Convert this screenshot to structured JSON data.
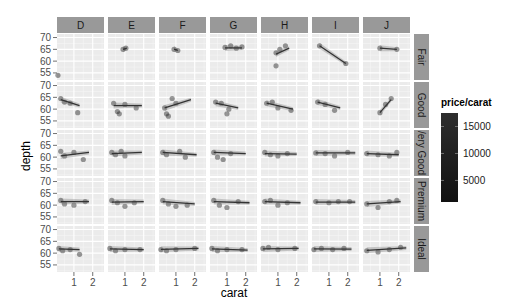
{
  "chart_data": {
    "type": "scatter",
    "title": "",
    "xlabel": "carat",
    "ylabel": "depth",
    "facet_cols": [
      "D",
      "E",
      "F",
      "G",
      "H",
      "I",
      "J"
    ],
    "facet_rows": [
      "Fair",
      "Good",
      "Very Good",
      "Premium",
      "Ideal"
    ],
    "facet_rows_displayed": [
      "Fair",
      "Good",
      "/ery Good",
      "Premium",
      "Ideal"
    ],
    "x_ticks": [
      1,
      2
    ],
    "y_ticks": [
      55,
      60,
      65,
      70
    ],
    "xlim": [
      0.1,
      2.6
    ],
    "ylim": [
      52,
      71.5
    ],
    "grid": true,
    "color_legend": {
      "title": "price/carat",
      "ticks": [
        5000,
        10000,
        15000
      ],
      "range": [
        1000,
        17500
      ],
      "low_color": "#2b2b2b",
      "high_color": "#0d0d0d",
      "position": "right"
    },
    "smooth_lines": {
      "Fair": {
        "D": null,
        "E": [
          [
            0.9,
            65.0
          ],
          [
            1.1,
            65.5
          ]
        ],
        "F": [
          [
            0.9,
            65.1
          ],
          [
            1.1,
            64.6
          ]
        ],
        "G": [
          [
            0.9,
            65.6
          ],
          [
            1.8,
            65.6
          ]
        ],
        "H": [
          [
            0.9,
            63.0
          ],
          [
            1.6,
            65.5
          ]
        ],
        "I": [
          [
            0.5,
            66.5
          ],
          [
            1.9,
            59.0
          ]
        ],
        "J": [
          [
            1.0,
            65.5
          ],
          [
            1.9,
            65.0
          ]
        ]
      },
      "Good": {
        "D": [
          [
            0.3,
            64.0
          ],
          [
            1.3,
            61.5
          ]
        ],
        "E": [
          [
            0.4,
            61.5
          ],
          [
            1.9,
            61.5
          ]
        ],
        "F": [
          [
            0.4,
            60.5
          ],
          [
            1.8,
            64.0
          ]
        ],
        "G": [
          [
            0.4,
            62.5
          ],
          [
            1.6,
            60.5
          ]
        ],
        "H": [
          [
            0.4,
            62.5
          ],
          [
            1.8,
            60.0
          ]
        ],
        "I": [
          [
            0.4,
            63.0
          ],
          [
            1.6,
            60.5
          ]
        ],
        "J": [
          [
            1.0,
            58.5
          ],
          [
            1.6,
            64.0
          ]
        ]
      },
      "Very Good": {
        "D": [
          [
            0.3,
            60.5
          ],
          [
            1.8,
            62.0
          ]
        ],
        "E": [
          [
            0.3,
            61.5
          ],
          [
            1.9,
            62.0
          ]
        ],
        "F": [
          [
            0.3,
            62.0
          ],
          [
            2.1,
            61.0
          ]
        ],
        "G": [
          [
            0.3,
            62.0
          ],
          [
            2.0,
            61.5
          ]
        ],
        "H": [
          [
            0.3,
            61.5
          ],
          [
            2.0,
            61.3
          ]
        ],
        "I": [
          [
            0.3,
            61.8
          ],
          [
            2.4,
            61.8
          ]
        ],
        "J": [
          [
            0.3,
            61.5
          ],
          [
            2.0,
            61.0
          ]
        ]
      },
      "Premium": {
        "D": [
          [
            0.3,
            61.5
          ],
          [
            1.8,
            61.5
          ]
        ],
        "E": [
          [
            0.3,
            61.3
          ],
          [
            2.0,
            61.5
          ]
        ],
        "F": [
          [
            0.3,
            61.5
          ],
          [
            2.0,
            60.5
          ]
        ],
        "G": [
          [
            0.3,
            61.5
          ],
          [
            2.2,
            61.0
          ]
        ],
        "H": [
          [
            0.3,
            61.5
          ],
          [
            2.2,
            61.0
          ]
        ],
        "I": [
          [
            0.3,
            61.3
          ],
          [
            2.4,
            61.3
          ]
        ],
        "J": [
          [
            0.3,
            60.5
          ],
          [
            2.1,
            61.5
          ]
        ]
      },
      "Ideal": {
        "D": [
          [
            0.2,
            61.8
          ],
          [
            1.3,
            61.5
          ]
        ],
        "E": [
          [
            0.2,
            61.8
          ],
          [
            2.0,
            61.5
          ]
        ],
        "F": [
          [
            0.2,
            61.6
          ],
          [
            2.2,
            62.0
          ]
        ],
        "G": [
          [
            0.2,
            61.8
          ],
          [
            2.1,
            61.3
          ]
        ],
        "H": [
          [
            0.2,
            61.8
          ],
          [
            2.1,
            62.0
          ]
        ],
        "I": [
          [
            0.2,
            61.8
          ],
          [
            2.2,
            61.7
          ]
        ],
        "J": [
          [
            0.3,
            61.2
          ],
          [
            2.4,
            62.2
          ]
        ]
      }
    },
    "point_clusters": {
      "Fair": {
        "D": [
          [
            0.15,
            54.0
          ]
        ],
        "E": [
          [
            0.9,
            65.0
          ],
          [
            1.05,
            65.5
          ]
        ],
        "F": [
          [
            0.9,
            65.0
          ],
          [
            1.1,
            64.5
          ]
        ],
        "G": [
          [
            0.9,
            65.8
          ],
          [
            1.2,
            66.5
          ],
          [
            1.5,
            65.5
          ],
          [
            1.8,
            66.0
          ]
        ],
        "H": [
          [
            0.9,
            63.5
          ],
          [
            1.1,
            65.0
          ],
          [
            1.4,
            66.5
          ],
          [
            0.9,
            58.0
          ]
        ],
        "I": [
          [
            0.5,
            66.5
          ],
          [
            1.9,
            59.0
          ]
        ],
        "J": [
          [
            1.0,
            65.5
          ],
          [
            1.9,
            65.0
          ]
        ]
      },
      "Good": {
        "D": [
          [
            0.3,
            64.5
          ],
          [
            0.5,
            63.0
          ],
          [
            0.8,
            62.5
          ],
          [
            1.2,
            58.5
          ]
        ],
        "E": [
          [
            0.4,
            62.5
          ],
          [
            0.6,
            59.0
          ],
          [
            0.7,
            58.0
          ],
          [
            1.0,
            62.0
          ],
          [
            1.6,
            60.5
          ]
        ],
        "F": [
          [
            0.4,
            60.5
          ],
          [
            0.5,
            58.0
          ],
          [
            0.8,
            64.5
          ],
          [
            1.0,
            62.5
          ],
          [
            0.6,
            57.0
          ]
        ],
        "G": [
          [
            0.4,
            63.0
          ],
          [
            0.7,
            62.5
          ],
          [
            1.1,
            60.0
          ],
          [
            1.0,
            58.0
          ]
        ],
        "H": [
          [
            0.4,
            62.5
          ],
          [
            0.7,
            63.0
          ],
          [
            1.0,
            60.5
          ],
          [
            1.7,
            59.5
          ]
        ],
        "I": [
          [
            0.4,
            63.0
          ],
          [
            0.8,
            62.0
          ],
          [
            1.3,
            59.5
          ]
        ],
        "J": [
          [
            1.0,
            58.5
          ],
          [
            1.3,
            62.0
          ],
          [
            1.6,
            64.5
          ]
        ]
      },
      "Very Good": {
        "D": [
          [
            0.3,
            62.5
          ],
          [
            0.5,
            60.5
          ],
          [
            1.0,
            62.0
          ],
          [
            1.5,
            59.0
          ]
        ],
        "E": [
          [
            0.3,
            62.0
          ],
          [
            0.5,
            61.0
          ],
          [
            0.8,
            62.5
          ],
          [
            1.0,
            60.5
          ]
        ],
        "F": [
          [
            0.3,
            62.0
          ],
          [
            0.5,
            61.0
          ],
          [
            1.2,
            62.5
          ],
          [
            1.5,
            60.0
          ]
        ],
        "G": [
          [
            0.3,
            62.0
          ],
          [
            0.5,
            60.0
          ],
          [
            0.8,
            59.0
          ],
          [
            1.2,
            61.5
          ]
        ],
        "H": [
          [
            0.3,
            62.0
          ],
          [
            0.6,
            61.0
          ],
          [
            1.0,
            60.5
          ],
          [
            1.5,
            61.5
          ]
        ],
        "I": [
          [
            0.3,
            61.8
          ],
          [
            0.8,
            61.5
          ],
          [
            1.3,
            60.5
          ],
          [
            2.0,
            62.0
          ]
        ],
        "J": [
          [
            0.3,
            61.5
          ],
          [
            0.9,
            61.0
          ],
          [
            1.5,
            60.5
          ],
          [
            1.9,
            62.0
          ]
        ]
      },
      "Premium": {
        "D": [
          [
            0.3,
            62.0
          ],
          [
            0.5,
            60.5
          ],
          [
            1.0,
            60.0
          ],
          [
            1.6,
            61.5
          ]
        ],
        "E": [
          [
            0.3,
            62.0
          ],
          [
            0.6,
            61.0
          ],
          [
            1.0,
            59.5
          ],
          [
            1.5,
            61.0
          ]
        ],
        "F": [
          [
            0.3,
            62.0
          ],
          [
            0.6,
            60.5
          ],
          [
            1.0,
            59.5
          ],
          [
            1.6,
            60.0
          ]
        ],
        "G": [
          [
            0.3,
            62.0
          ],
          [
            0.6,
            60.0
          ],
          [
            1.0,
            59.0
          ],
          [
            1.6,
            61.5
          ]
        ],
        "H": [
          [
            0.3,
            61.5
          ],
          [
            0.6,
            62.0
          ],
          [
            1.0,
            60.0
          ],
          [
            1.5,
            61.0
          ]
        ],
        "I": [
          [
            0.3,
            61.5
          ],
          [
            1.0,
            61.0
          ],
          [
            1.5,
            61.5
          ],
          [
            2.1,
            61.5
          ]
        ],
        "J": [
          [
            0.3,
            60.5
          ],
          [
            0.9,
            59.0
          ],
          [
            1.5,
            61.5
          ],
          [
            1.9,
            62.0
          ]
        ]
      },
      "Ideal": {
        "D": [
          [
            0.2,
            62.0
          ],
          [
            0.4,
            61.0
          ],
          [
            0.8,
            61.5
          ],
          [
            1.3,
            59.5
          ]
        ],
        "E": [
          [
            0.2,
            62.0
          ],
          [
            0.5,
            61.0
          ],
          [
            1.0,
            61.5
          ],
          [
            1.8,
            61.5
          ]
        ],
        "F": [
          [
            0.2,
            61.5
          ],
          [
            0.5,
            61.0
          ],
          [
            1.0,
            61.5
          ],
          [
            2.0,
            62.0
          ]
        ],
        "G": [
          [
            0.2,
            62.0
          ],
          [
            0.5,
            61.0
          ],
          [
            1.0,
            61.5
          ],
          [
            1.8,
            61.5
          ]
        ],
        "H": [
          [
            0.2,
            62.0
          ],
          [
            0.5,
            62.5
          ],
          [
            1.0,
            61.5
          ],
          [
            1.9,
            62.0
          ]
        ],
        "I": [
          [
            0.2,
            61.5
          ],
          [
            0.6,
            62.0
          ],
          [
            1.2,
            61.5
          ],
          [
            1.8,
            62.0
          ]
        ],
        "J": [
          [
            0.3,
            61.0
          ],
          [
            0.9,
            60.5
          ],
          [
            1.5,
            61.5
          ],
          [
            2.1,
            62.5
          ]
        ]
      }
    }
  }
}
